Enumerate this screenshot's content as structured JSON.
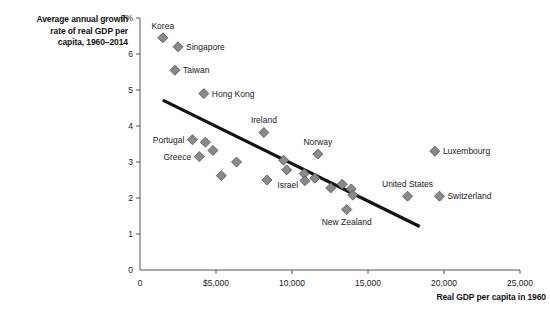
{
  "chart_data": {
    "type": "scatter",
    "title": "Average annual growth rate of real GDP per capita, 1960–2014",
    "title_lines": [
      "Average annual growth",
      "rate of real GDP per",
      "capita, 1960–2014"
    ],
    "xlabel": "Real GDP per capita in 1960",
    "ylabel": "Average annual growth rate of real GDP per capita, 1960–2014",
    "xlim": [
      0,
      25000
    ],
    "ylim": [
      0,
      7
    ],
    "grid": false,
    "legend": "none",
    "xticks": [
      0,
      5000,
      10000,
      15000,
      20000,
      25000
    ],
    "xticklabels": [
      "0",
      "$5,000",
      "10,000",
      "15,000",
      "20,000",
      "25,000"
    ],
    "yticks": [
      0,
      1,
      2,
      3,
      4,
      5,
      6,
      7
    ],
    "yticklabels": [
      "0",
      "1",
      "2",
      "3",
      "4",
      "5",
      "6",
      "7%"
    ],
    "series": [
      {
        "name": "Countries",
        "marker": "diamond",
        "color": "#8a8a8a",
        "points": [
          {
            "label": "Korea",
            "x": 1500,
            "y": 6.45,
            "label_pos": "above"
          },
          {
            "label": "Singapore",
            "x": 2500,
            "y": 6.2,
            "label_pos": "right"
          },
          {
            "label": "Taiwan",
            "x": 2300,
            "y": 5.55,
            "label_pos": "right"
          },
          {
            "label": "Hong Kong",
            "x": 4200,
            "y": 4.9,
            "label_pos": "right"
          },
          {
            "label": "Ireland",
            "x": 8150,
            "y": 3.82,
            "label_pos": "above"
          },
          {
            "label": "Portugal",
            "x": 3450,
            "y": 3.62,
            "label_pos": "left"
          },
          {
            "label": "",
            "x": 4300,
            "y": 3.55
          },
          {
            "label": "",
            "x": 4800,
            "y": 3.32
          },
          {
            "label": "Greece",
            "x": 3900,
            "y": 3.15,
            "label_pos": "left"
          },
          {
            "label": "Norway",
            "x": 11700,
            "y": 3.22,
            "label_pos": "above"
          },
          {
            "label": "",
            "x": 6350,
            "y": 3.0
          },
          {
            "label": "",
            "x": 9450,
            "y": 3.05
          },
          {
            "label": "",
            "x": 9650,
            "y": 2.78
          },
          {
            "label": "",
            "x": 5350,
            "y": 2.62
          },
          {
            "label": "",
            "x": 8350,
            "y": 2.5
          },
          {
            "label": "Israel",
            "x": 10800,
            "y": 2.68,
            "label_pos": "below-left"
          },
          {
            "label": "",
            "x": 10850,
            "y": 2.48
          },
          {
            "label": "",
            "x": 11500,
            "y": 2.55
          },
          {
            "label": "",
            "x": 12550,
            "y": 2.28
          },
          {
            "label": "",
            "x": 13300,
            "y": 2.38
          },
          {
            "label": "",
            "x": 13900,
            "y": 2.25
          },
          {
            "label": "",
            "x": 14000,
            "y": 2.08
          },
          {
            "label": "New Zealand",
            "x": 13600,
            "y": 1.68,
            "label_pos": "below"
          },
          {
            "label": "United States",
            "x": 17600,
            "y": 2.05,
            "label_pos": "above"
          },
          {
            "label": "Luxembourg",
            "x": 19400,
            "y": 3.3,
            "label_pos": "right"
          },
          {
            "label": "Switzerland",
            "x": 19700,
            "y": 2.05,
            "label_pos": "right"
          }
        ]
      }
    ],
    "trendline": {
      "x_start": 1500,
      "y_start": 4.72,
      "x_end": 18400,
      "y_end": 1.21,
      "color": "#111111"
    }
  }
}
